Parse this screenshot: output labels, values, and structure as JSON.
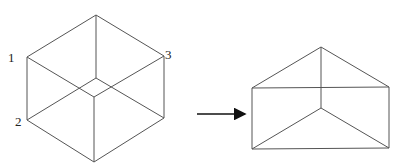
{
  "figure_left": {
    "type": "ambiguous-cube-wireframe",
    "labels": [
      {
        "text": "1",
        "x": 8,
        "y": 51
      },
      {
        "text": "2",
        "x": 15,
        "y": 115
      },
      {
        "text": "3",
        "x": 165,
        "y": 48
      }
    ],
    "edges": [
      [
        96,
        15,
        27,
        57
      ],
      [
        96,
        15,
        164,
        56
      ],
      [
        27,
        57,
        27,
        120
      ],
      [
        164,
        56,
        164,
        118
      ],
      [
        27,
        120,
        94,
        162
      ],
      [
        164,
        118,
        94,
        162
      ],
      [
        96,
        15,
        96,
        78
      ],
      [
        96,
        78,
        27,
        120
      ],
      [
        96,
        78,
        164,
        118
      ],
      [
        27,
        57,
        94,
        97
      ],
      [
        164,
        56,
        94,
        97
      ],
      [
        94,
        97,
        94,
        162
      ]
    ]
  },
  "arrow": {
    "x1": 197,
    "y1": 114,
    "x2": 245,
    "y2": 114,
    "color": "#111111"
  },
  "figure_right": {
    "type": "triangular-prism-wireframe",
    "edges": [
      [
        321,
        47,
        252,
        88
      ],
      [
        321,
        47,
        389,
        87
      ],
      [
        252,
        88,
        389,
        87
      ],
      [
        321,
        47,
        321,
        108
      ],
      [
        252,
        88,
        252,
        149
      ],
      [
        389,
        87,
        389,
        148
      ],
      [
        252,
        149,
        389,
        148
      ],
      [
        321,
        108,
        252,
        149
      ],
      [
        321,
        108,
        389,
        148
      ]
    ]
  },
  "colors": {
    "line": "#555555",
    "background": "#ffffff"
  }
}
